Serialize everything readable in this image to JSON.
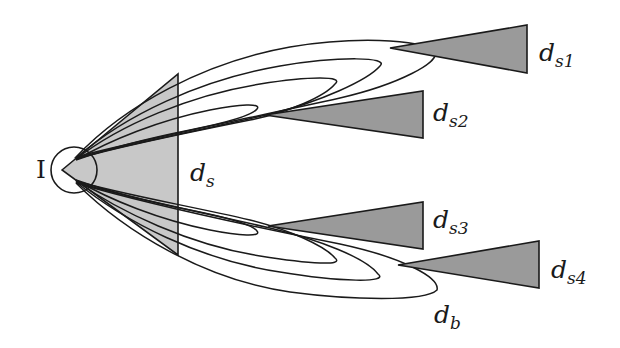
{
  "diagram": {
    "type": "antenna-beam-pattern",
    "colors": {
      "triangle_fill": "#9a9a9a",
      "source_triangle_fill": "#c8c8c8",
      "stroke": "#1a1a1a",
      "background": "#ffffff"
    },
    "labels": {
      "source": "I",
      "ds": {
        "base": "d",
        "sub": "s"
      },
      "ds1": {
        "base": "d",
        "sub": "s1"
      },
      "ds2": {
        "base": "d",
        "sub": "s2"
      },
      "ds3": {
        "base": "d",
        "sub": "s3"
      },
      "ds4": {
        "base": "d",
        "sub": "s4"
      },
      "db": {
        "base": "d",
        "sub": "b"
      }
    },
    "nodes": [
      {
        "id": "I",
        "shape": "circle",
        "cx": 74,
        "cy": 170,
        "r": 23
      },
      {
        "id": "ds",
        "shape": "triangle",
        "apex": [
          62,
          170
        ],
        "top": [
          178,
          74
        ],
        "bottom": [
          178,
          255
        ]
      },
      {
        "id": "ds1",
        "shape": "triangle",
        "apex": [
          390,
          48
        ],
        "top": [
          527,
          25
        ],
        "bottom": [
          527,
          73
        ]
      },
      {
        "id": "ds2",
        "shape": "triangle",
        "apex": [
          265,
          115
        ],
        "top": [
          423,
          91
        ],
        "bottom": [
          423,
          138
        ]
      },
      {
        "id": "ds3",
        "shape": "triangle",
        "apex": [
          268,
          226
        ],
        "top": [
          423,
          202
        ],
        "bottom": [
          423,
          249
        ]
      },
      {
        "id": "ds4",
        "shape": "triangle",
        "apex": [
          398,
          265
        ],
        "top": [
          539,
          241
        ],
        "bottom": [
          539,
          288
        ]
      }
    ],
    "lobes": [
      {
        "group": "upper",
        "tip": [
          257,
          107
        ]
      },
      {
        "group": "upper",
        "tip": [
          335,
          82
        ]
      },
      {
        "group": "upper",
        "tip": [
          380,
          65
        ]
      },
      {
        "group": "upper",
        "tip": [
          435,
          55
        ]
      },
      {
        "group": "lower",
        "tip": [
          257,
          235
        ]
      },
      {
        "group": "lower",
        "tip": [
          335,
          262
        ]
      },
      {
        "group": "lower",
        "tip": [
          378,
          275
        ]
      },
      {
        "group": "lower",
        "tip": [
          437,
          288
        ],
        "label": "db"
      }
    ]
  }
}
